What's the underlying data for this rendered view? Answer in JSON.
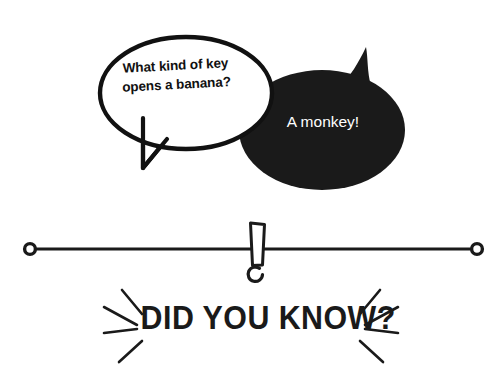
{
  "canvas": {
    "width": 502,
    "height": 387,
    "background_color": "#ffffff"
  },
  "colors": {
    "ink": "#1a1a1a",
    "outline": "#111111",
    "bubble_dark_fill": "#1a1a1a",
    "bubble_light_fill": "#ffffff",
    "text_on_dark": "#ffffff",
    "text_on_light": "#111111"
  },
  "joke": {
    "question_bubble": {
      "text": "What kind of key opens a banana?",
      "lines": [
        "What kind of",
        "key opens a",
        "banana?"
      ],
      "style": "outlined-white-ellipse",
      "tail": "down-v"
    },
    "answer_bubble": {
      "text": "A monkey!",
      "lines": [
        "A monkey!"
      ],
      "style": "solid-black-ellipse",
      "tail": "up-right-horn"
    }
  },
  "divider": {
    "name": "exclamation-rule",
    "left_endpoint_label": "circle",
    "right_endpoint_label": "circle",
    "center_glyph": "!"
  },
  "banner": {
    "title": "DID YOU KNOW?",
    "ray_count_left": 3,
    "ray_count_right": 3
  }
}
